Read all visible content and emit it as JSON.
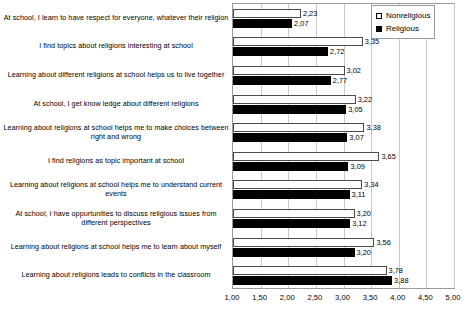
{
  "chart_data": {
    "type": "bar",
    "orientation": "horizontal",
    "title": "",
    "xlabel": "",
    "ylabel": "",
    "xlim": [
      1.0,
      5.0
    ],
    "xticks": [
      1.0,
      1.5,
      2.0,
      2.5,
      3.0,
      3.5,
      4.0,
      4.5,
      5.0
    ],
    "xtick_labels": [
      "1,00",
      "1,50",
      "2,00",
      "2,50",
      "3,00",
      "3,50",
      "4,00",
      "4,50",
      "5,00"
    ],
    "grid": true,
    "legend_position": "top-right",
    "decimal_separator": ",",
    "categories": [
      "At school, I learn to have respect for everyone, whatever their religion",
      "I find topics about religions interesting at school",
      "Learning about different religions at school helps us to live together",
      "At school, I get know ledge about different religions",
      "Learning about religions at school helps me to make choices between right and wrong",
      "I find religions as topic important at school",
      "Learning about religions at school helps me to understand current events",
      "At school, I have oppurtunities to discuss religious issues from different perspectives",
      "Learning about religions at school helps me to learn about myself",
      "Learning about religions leads to conflicts in the classroom"
    ],
    "series": [
      {
        "name": "Nonreligious",
        "color": "#ffffff",
        "values": [
          2.23,
          3.35,
          3.02,
          3.22,
          3.38,
          3.65,
          3.34,
          3.2,
          3.56,
          3.78
        ],
        "value_labels": [
          "2,23",
          "3,35",
          "3,02",
          "3,22",
          "3,38",
          "3,65",
          "3,34",
          "3,20",
          "3,56",
          "3,78"
        ]
      },
      {
        "name": "Religious",
        "color": "#000000",
        "values": [
          2.07,
          2.72,
          2.77,
          3.05,
          3.07,
          3.09,
          3.11,
          3.12,
          3.2,
          3.88
        ],
        "value_labels": [
          "2,07",
          "2,72",
          "2,77",
          "3,05",
          "3,07",
          "3,09",
          "3,11",
          "3,12",
          "3,20",
          "3,88"
        ]
      }
    ]
  },
  "legend": {
    "items": [
      {
        "label": "Nonreligious",
        "swatch": "open-square-swatch"
      },
      {
        "label": "Religious",
        "swatch": "filled-square-swatch"
      }
    ]
  }
}
